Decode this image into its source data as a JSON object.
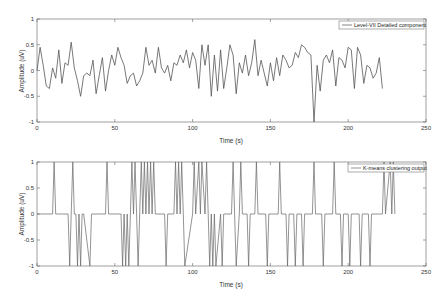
{
  "chart_data": [
    {
      "type": "line",
      "title": "",
      "xlabel": "Time (s)",
      "ylabel": "Amplitude (uV)",
      "xlim": [
        0,
        250
      ],
      "ylim": [
        -1,
        1
      ],
      "xticks": [
        "0",
        "50",
        "100",
        "150",
        "200",
        "250"
      ],
      "yticks": [
        "-1",
        "-0.5",
        "0",
        "0.5",
        "1"
      ],
      "grid": false,
      "legend_position": "upper right",
      "series": [
        {
          "name": "Level-VII Detailed component",
          "color": "#555555",
          "x": [
            0,
            2,
            4,
            6,
            8,
            10,
            12,
            14,
            16,
            18,
            20,
            22,
            24,
            26,
            28,
            30,
            32,
            34,
            36,
            38,
            40,
            42,
            44,
            46,
            48,
            50,
            52,
            54,
            56,
            58,
            60,
            62,
            64,
            66,
            68,
            70,
            72,
            74,
            76,
            78,
            80,
            82,
            84,
            86,
            88,
            90,
            92,
            94,
            96,
            98,
            100,
            102,
            104,
            106,
            108,
            110,
            112,
            114,
            116,
            118,
            120,
            122,
            124,
            126,
            128,
            130,
            132,
            134,
            136,
            138,
            140,
            142,
            144,
            146,
            148,
            150,
            152,
            154,
            156,
            158,
            160,
            162,
            164,
            166,
            168,
            170,
            172,
            174,
            176,
            178,
            180,
            182,
            184,
            186,
            188,
            190,
            192,
            194,
            196,
            198,
            200,
            202,
            204,
            206,
            208,
            210,
            212,
            214,
            216,
            218,
            220,
            222,
            224,
            226,
            228,
            230,
            232,
            234,
            236,
            238,
            240,
            242,
            244,
            246,
            248,
            250
          ],
          "values": [
            0,
            0.45,
            0.1,
            -0.3,
            -0.35,
            0.05,
            -0.15,
            0.4,
            -0.25,
            0.15,
            0.1,
            0.55,
            0.05,
            -0.2,
            -0.5,
            -0.1,
            -0.05,
            -0.1,
            0.2,
            -0.45,
            -0.1,
            0.25,
            -0.4,
            0,
            0.3,
            0.1,
            0.45,
            0.25,
            0.1,
            -0.25,
            -0.1,
            -0.05,
            -0.3,
            -0.2,
            -0.05,
            0.45,
            0.1,
            0.2,
            -0.05,
            0.45,
            0.05,
            -0.05,
            0.1,
            -0.2,
            0.15,
            0.1,
            0.3,
            0.15,
            0.4,
            0.05,
            0.35,
            0.2,
            -0.35,
            0.5,
            0.1,
            0.5,
            -0.5,
            0.3,
            -0.4,
            0.4,
            -0.35,
            0.05,
            0.5,
            0.3,
            -0.45,
            0.15,
            -0.05,
            0.3,
            -0.1,
            0.15,
            0.6,
            -0.1,
            0.2,
            -0.05,
            -0.3,
            0.15,
            -0.2,
            0.25,
            -0.1,
            0.3,
            0.2,
            0.05,
            0.1,
            0.35,
            0.25,
            0.5,
            0.45,
            0.35,
            0.3,
            -1.0,
            0.1,
            -0.4,
            0.2,
            0.3,
            0.15,
            0.4,
            -0.3,
            0.25,
            0.2,
            0.05,
            0.45,
            0.4,
            -0.35,
            0.45,
            0.3,
            -0.25,
            0.1,
            0.05,
            -0.15,
            -0.05,
            0.25,
            -0.35
          ]
        }
      ]
    },
    {
      "type": "line",
      "title": "",
      "xlabel": "Time (s)",
      "ylabel": "Amplitude (uV)",
      "xlim": [
        0,
        250
      ],
      "ylim": [
        -1,
        1
      ],
      "xticks": [
        "0",
        "50",
        "100",
        "150",
        "200",
        "250"
      ],
      "yticks": [
        "-1",
        "-0.5",
        "0",
        "0.5",
        "1"
      ],
      "grid": false,
      "legend_position": "upper right",
      "series": [
        {
          "name": "K-means clustering output",
          "color": "#666666",
          "x": [
            0,
            10,
            11,
            12,
            20,
            21,
            22,
            23,
            24,
            25,
            26,
            27,
            28,
            29,
            30,
            34,
            35,
            36,
            44,
            45,
            46,
            54,
            55,
            56,
            57,
            58,
            59,
            60,
            61,
            62,
            63,
            64,
            65,
            66,
            67,
            68,
            69,
            70,
            71,
            72,
            73,
            74,
            75,
            76,
            82,
            83,
            84,
            88,
            89,
            90,
            91,
            92,
            93,
            94,
            95,
            100,
            101,
            102,
            104,
            105,
            106,
            108,
            109,
            110,
            111,
            112,
            113,
            114,
            115,
            118,
            119,
            120,
            125,
            126,
            127,
            128,
            130,
            131,
            132,
            135,
            136,
            137,
            140,
            141,
            142,
            147,
            148,
            149,
            155,
            156,
            157,
            160,
            161,
            162,
            165,
            166,
            167,
            170,
            171,
            172,
            177,
            178,
            179,
            183,
            184,
            185,
            190,
            191,
            192,
            195,
            196,
            197,
            200,
            201,
            202,
            207,
            208,
            209,
            213,
            214,
            215,
            222,
            223,
            224,
            227,
            228,
            229,
            230,
            231,
            232,
            250
          ],
          "values": [
            0,
            0,
            1,
            0,
            0,
            -1,
            0,
            1,
            0,
            0,
            -1,
            0,
            -1,
            0,
            0,
            -1,
            0,
            0,
            0,
            1,
            0,
            0,
            -1,
            0,
            -1,
            0,
            -1,
            0,
            1,
            0,
            1,
            0,
            -1,
            0,
            1,
            0,
            1,
            0,
            1,
            0,
            1,
            0,
            1,
            0,
            0,
            -1,
            0,
            0,
            1,
            0,
            1,
            0,
            1,
            0,
            -1,
            0,
            1,
            0,
            1,
            0,
            1,
            0,
            1,
            0,
            -1,
            0,
            -1,
            0,
            -1,
            0,
            -1,
            0,
            0,
            1,
            0,
            -1,
            0,
            1,
            0,
            0,
            -1,
            0,
            0,
            1,
            0,
            0,
            -1,
            0,
            0,
            1,
            0,
            0,
            -1,
            0,
            0,
            -1,
            0,
            0,
            -1,
            0,
            0,
            1,
            0,
            0,
            -1,
            0,
            0,
            1,
            0,
            0,
            -1,
            0,
            0,
            -1,
            0,
            0,
            -1,
            0,
            0,
            -1,
            0,
            0,
            1,
            0,
            1,
            0,
            1,
            0
          ]
        }
      ]
    }
  ],
  "plots": [
    {
      "ylabel": "Amplitude (uV)",
      "xlabel": "Time (s)",
      "legend": "Level-VII Detailed component",
      "xticks": [
        "0",
        "50",
        "100",
        "150",
        "200",
        "250"
      ],
      "yticks": [
        "1",
        "0.5",
        "0",
        "-0.5",
        "-1"
      ]
    },
    {
      "ylabel": "Amplitude (uV)",
      "xlabel": "Time (s)",
      "legend": "K-means clustering output",
      "xticks": [
        "0",
        "50",
        "100",
        "150",
        "200",
        "250"
      ],
      "yticks": [
        "1",
        "0.5",
        "0",
        "-0.5",
        "-1"
      ]
    }
  ]
}
